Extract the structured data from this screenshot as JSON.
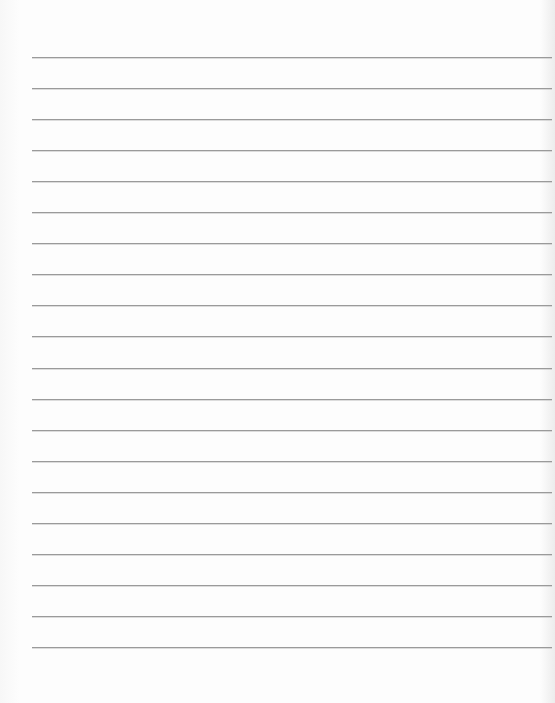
{
  "paper": {
    "type": "lined-paper",
    "line_count": 20,
    "first_line_y": 57,
    "line_spacing": 31.05,
    "line_left": 32,
    "line_width": 520,
    "line_color": "#9a9a9a",
    "background_color": "#fbfbfb"
  }
}
